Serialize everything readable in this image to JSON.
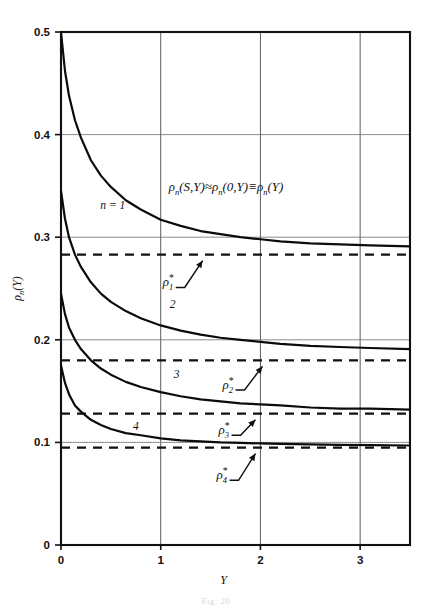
{
  "figure": {
    "caption_fragment": "Fig.  20",
    "top_fragment": ""
  },
  "chart_data": {
    "type": "line",
    "title": "",
    "xlabel": "Y",
    "ylabel": "ρₙ(Y)",
    "xlim": [
      0,
      3.5
    ],
    "ylim": [
      0,
      0.5
    ],
    "xticks": [
      0,
      1,
      2,
      3
    ],
    "xtick_labels": [
      "0",
      "1",
      "2",
      "3"
    ],
    "yticks": [
      0,
      0.1,
      0.2,
      0.3,
      0.4,
      0.5
    ],
    "ytick_labels": [
      "0",
      "0.1",
      "0.2",
      "0.3",
      "0.4",
      "0.5"
    ],
    "grid": "both",
    "legend": "inline-curve-labels",
    "annotation": "ρₙ(S,Y) ≈ ρₙ(0,Y) ≡ ρₙ(Y)",
    "annotation_x": 1.08,
    "annotation_y": 0.345,
    "series": [
      {
        "name": "n = 1",
        "label": "n = 1",
        "label_x": 0.52,
        "label_y": 0.327,
        "asymptote": 0.283,
        "asymptote_label": "ρ₁*",
        "x": [
          0,
          0.04,
          0.08,
          0.14,
          0.2,
          0.3,
          0.4,
          0.5,
          0.65,
          0.8,
          1.0,
          1.2,
          1.4,
          1.6,
          1.8,
          2.0,
          2.2,
          2.5,
          2.8,
          3.1,
          3.5
        ],
        "y": [
          0.5,
          0.462,
          0.438,
          0.414,
          0.397,
          0.375,
          0.36,
          0.349,
          0.336,
          0.327,
          0.317,
          0.311,
          0.306,
          0.303,
          0.3,
          0.298,
          0.296,
          0.294,
          0.293,
          0.292,
          0.291
        ]
      },
      {
        "name": "2",
        "label": "2",
        "label_x": 1.12,
        "label_y": 0.231,
        "asymptote": 0.18,
        "asymptote_label": "ρ₂*",
        "x": [
          0,
          0.04,
          0.08,
          0.14,
          0.2,
          0.3,
          0.4,
          0.5,
          0.65,
          0.8,
          1.0,
          1.2,
          1.4,
          1.6,
          1.8,
          2.0,
          2.2,
          2.5,
          2.8,
          3.1,
          3.5
        ],
        "y": [
          0.345,
          0.318,
          0.3,
          0.283,
          0.271,
          0.256,
          0.245,
          0.237,
          0.228,
          0.221,
          0.214,
          0.209,
          0.205,
          0.202,
          0.2,
          0.198,
          0.196,
          0.194,
          0.193,
          0.192,
          0.191
        ]
      },
      {
        "name": "3",
        "label": "3",
        "label_x": 1.16,
        "label_y": 0.163,
        "asymptote": 0.128,
        "asymptote_label": "ρ₃*",
        "x": [
          0,
          0.04,
          0.08,
          0.14,
          0.2,
          0.3,
          0.4,
          0.5,
          0.65,
          0.8,
          1.0,
          1.2,
          1.4,
          1.6,
          1.8,
          2.0,
          2.2,
          2.5,
          2.8,
          3.1,
          3.5
        ],
        "y": [
          0.245,
          0.225,
          0.212,
          0.2,
          0.191,
          0.18,
          0.172,
          0.166,
          0.159,
          0.154,
          0.149,
          0.145,
          0.142,
          0.14,
          0.138,
          0.137,
          0.136,
          0.134,
          0.133,
          0.133,
          0.132
        ]
      },
      {
        "name": "4",
        "label": "4",
        "label_x": 0.75,
        "label_y": 0.112,
        "asymptote": 0.095,
        "asymptote_label": "ρ₄*",
        "x": [
          0,
          0.04,
          0.08,
          0.14,
          0.2,
          0.3,
          0.4,
          0.5,
          0.65,
          0.8,
          1.0,
          1.2,
          1.4,
          1.6,
          1.8,
          2.0,
          2.2,
          2.5,
          2.8,
          3.1,
          3.5
        ],
        "y": [
          0.175,
          0.158,
          0.147,
          0.136,
          0.13,
          0.122,
          0.117,
          0.113,
          0.109,
          0.107,
          0.104,
          0.102,
          0.101,
          0.1,
          0.0995,
          0.099,
          0.0985,
          0.098,
          0.0975,
          0.0973,
          0.097
        ]
      }
    ],
    "asymptote_labels": [
      {
        "text": "ρ₁*",
        "base": "ρ",
        "sub": "1",
        "star": "*",
        "x": 1.02,
        "y": 0.252,
        "arrow_to_x": 1.42,
        "arrow_to_y": 0.281
      },
      {
        "text": "ρ₂*",
        "base": "ρ",
        "sub": "2",
        "star": "*",
        "x": 1.62,
        "y": 0.152,
        "arrow_to_x": 2.02,
        "arrow_to_y": 0.178
      },
      {
        "text": "ρ₃*",
        "base": "ρ",
        "sub": "3",
        "star": "*",
        "x": 1.58,
        "y": 0.108,
        "arrow_to_x": 1.95,
        "arrow_to_y": 0.126
      },
      {
        "text": "ρ₄*",
        "base": "ρ",
        "sub": "4",
        "star": "*",
        "x": 1.56,
        "y": 0.064,
        "arrow_to_x": 1.95,
        "arrow_to_y": 0.093
      }
    ]
  }
}
